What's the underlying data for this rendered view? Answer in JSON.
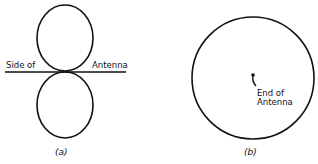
{
  "figure_a": {
    "caption": "(a)",
    "label_left": "Side of",
    "label_right": "Antenna",
    "pattern": "figure-eight (two lobes perpendicular to antenna)"
  },
  "figure_b": {
    "caption": "(b)",
    "label_line1": "End of",
    "label_line2": "Antenna",
    "pattern": "circle (omnidirectional, viewed from end)"
  },
  "colors": {
    "stroke": "#111111",
    "background": "#ffffff"
  }
}
